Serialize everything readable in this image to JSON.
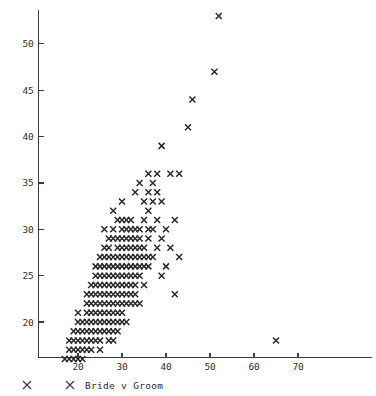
{
  "chart_data": {
    "type": "scatter",
    "title": "",
    "subtitle": "",
    "xlabel": "",
    "ylabel": "",
    "legend_label": "Bride v Groom",
    "legend_marker": "x",
    "legend_position": "below-axis-left",
    "grid": false,
    "xlim": [
      14,
      72
    ],
    "ylim": [
      15.5,
      54.5
    ],
    "xticks": [
      20,
      30,
      40,
      50,
      60,
      70
    ],
    "yticks": [
      20,
      25,
      30,
      35,
      40,
      45,
      50
    ],
    "xtick_labels": [
      "20",
      "30",
      "40",
      "50",
      "60",
      "70"
    ],
    "ytick_labels": [
      "20",
      "25",
      "30",
      "35",
      "40",
      "45",
      "50"
    ],
    "marker_color": "#262626",
    "axis_color": "#3a3a3a",
    "background_color": "#ffffff",
    "n_points": 186,
    "series": [
      {
        "name": "Bride v Groom",
        "marker": "x",
        "points": [
          [
            17,
            16
          ],
          [
            18,
            16
          ],
          [
            18,
            17
          ],
          [
            19,
            16
          ],
          [
            19,
            17
          ],
          [
            19,
            18
          ],
          [
            20,
            16
          ],
          [
            20,
            17
          ],
          [
            20,
            18
          ],
          [
            20,
            20
          ],
          [
            21,
            16
          ],
          [
            21,
            19
          ],
          [
            21,
            20
          ],
          [
            22,
            17
          ],
          [
            22,
            19
          ],
          [
            22,
            21
          ],
          [
            22,
            22
          ],
          [
            22,
            23
          ],
          [
            23,
            18
          ],
          [
            23,
            20
          ],
          [
            23,
            21
          ],
          [
            23,
            22
          ],
          [
            23,
            23
          ],
          [
            23,
            24
          ],
          [
            24,
            19
          ],
          [
            24,
            21
          ],
          [
            24,
            22
          ],
          [
            24,
            23
          ],
          [
            24,
            24
          ],
          [
            24,
            25
          ],
          [
            24,
            26
          ],
          [
            25,
            17
          ],
          [
            25,
            20
          ],
          [
            25,
            21
          ],
          [
            25,
            22
          ],
          [
            25,
            23
          ],
          [
            25,
            24
          ],
          [
            25,
            25
          ],
          [
            25,
            26
          ],
          [
            25,
            27
          ],
          [
            26,
            19
          ],
          [
            26,
            21
          ],
          [
            26,
            22
          ],
          [
            26,
            23
          ],
          [
            26,
            24
          ],
          [
            26,
            25
          ],
          [
            26,
            26
          ],
          [
            26,
            28
          ],
          [
            26,
            30
          ],
          [
            27,
            18
          ],
          [
            27,
            20
          ],
          [
            27,
            21
          ],
          [
            27,
            22
          ],
          [
            27,
            23
          ],
          [
            27,
            24
          ],
          [
            27,
            25
          ],
          [
            27,
            26
          ],
          [
            27,
            27
          ],
          [
            27,
            28
          ],
          [
            28,
            19
          ],
          [
            28,
            20
          ],
          [
            28,
            21
          ],
          [
            28,
            22
          ],
          [
            28,
            23
          ],
          [
            28,
            24
          ],
          [
            28,
            25
          ],
          [
            28,
            26
          ],
          [
            28,
            27
          ],
          [
            28,
            30
          ],
          [
            28,
            32
          ],
          [
            29,
            20
          ],
          [
            29,
            22
          ],
          [
            29,
            23
          ],
          [
            29,
            24
          ],
          [
            29,
            25
          ],
          [
            29,
            26
          ],
          [
            29,
            28
          ],
          [
            29,
            29
          ],
          [
            29,
            31
          ],
          [
            30,
            20
          ],
          [
            30,
            22
          ],
          [
            30,
            23
          ],
          [
            30,
            24
          ],
          [
            30,
            25
          ],
          [
            30,
            26
          ],
          [
            30,
            27
          ],
          [
            30,
            28
          ],
          [
            30,
            29
          ],
          [
            30,
            30
          ],
          [
            30,
            33
          ],
          [
            31,
            23
          ],
          [
            31,
            24
          ],
          [
            31,
            25
          ],
          [
            31,
            26
          ],
          [
            31,
            27
          ],
          [
            31,
            28
          ],
          [
            31,
            29
          ],
          [
            31,
            30
          ],
          [
            32,
            23
          ],
          [
            32,
            24
          ],
          [
            32,
            25
          ],
          [
            32,
            26
          ],
          [
            32,
            27
          ],
          [
            32,
            28
          ],
          [
            32,
            29
          ],
          [
            32,
            31
          ],
          [
            33,
            23
          ],
          [
            33,
            24
          ],
          [
            33,
            25
          ],
          [
            33,
            26
          ],
          [
            33,
            28
          ],
          [
            33,
            29
          ],
          [
            33,
            30
          ],
          [
            33,
            34
          ],
          [
            34,
            22
          ],
          [
            34,
            25
          ],
          [
            34,
            26
          ],
          [
            34,
            27
          ],
          [
            34,
            29
          ],
          [
            34,
            30
          ],
          [
            34,
            35
          ],
          [
            35,
            24
          ],
          [
            35,
            26
          ],
          [
            35,
            28
          ],
          [
            35,
            31
          ],
          [
            35,
            33
          ],
          [
            36,
            26
          ],
          [
            36,
            27
          ],
          [
            36,
            29
          ],
          [
            36,
            32
          ],
          [
            36,
            34
          ],
          [
            36,
            36
          ],
          [
            37,
            27
          ],
          [
            37,
            30
          ],
          [
            37,
            33
          ],
          [
            37,
            35
          ],
          [
            38,
            28
          ],
          [
            38,
            31
          ],
          [
            38,
            34
          ],
          [
            38,
            36
          ],
          [
            39,
            25
          ],
          [
            39,
            29
          ],
          [
            39,
            33
          ],
          [
            39,
            39
          ],
          [
            40,
            26
          ],
          [
            40,
            30
          ],
          [
            41,
            28
          ],
          [
            41,
            36
          ],
          [
            42,
            23
          ],
          [
            42,
            31
          ],
          [
            43,
            27
          ],
          [
            43,
            36
          ],
          [
            45,
            41
          ],
          [
            46,
            44
          ],
          [
            51,
            47
          ],
          [
            52,
            53
          ],
          [
            65,
            18
          ],
          [
            20,
            19
          ],
          [
            21,
            18
          ],
          [
            22,
            20
          ],
          [
            23,
            19
          ],
          [
            24,
            20
          ],
          [
            25,
            19
          ],
          [
            26,
            20
          ],
          [
            27,
            19
          ],
          [
            28,
            18
          ],
          [
            29,
            21
          ],
          [
            30,
            21
          ],
          [
            31,
            22
          ],
          [
            32,
            22
          ],
          [
            33,
            22
          ],
          [
            26,
            27
          ],
          [
            27,
            29
          ],
          [
            28,
            29
          ],
          [
            29,
            27
          ],
          [
            30,
            31
          ],
          [
            31,
            31
          ],
          [
            32,
            30
          ],
          [
            33,
            27
          ],
          [
            34,
            28
          ],
          [
            35,
            27
          ],
          [
            36,
            30
          ],
          [
            24,
            18
          ],
          [
            25,
            18
          ],
          [
            23,
            17
          ],
          [
            22,
            18
          ],
          [
            21,
            17
          ],
          [
            29,
            19
          ],
          [
            31,
            20
          ],
          [
            19,
            19
          ],
          [
            20,
            21
          ],
          [
            18,
            18
          ]
        ]
      }
    ]
  },
  "axes": {
    "x_axis_name": "x-axis",
    "y_axis_name": "y-axis"
  }
}
